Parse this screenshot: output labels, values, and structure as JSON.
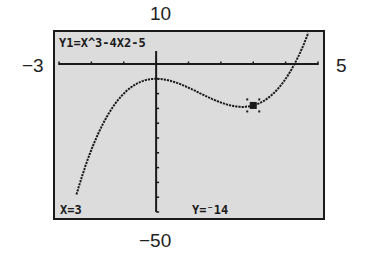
{
  "window": {
    "xmin_label": "−3",
    "xmax_label": "5",
    "ymax_label": "10",
    "ymin_label": "−50"
  },
  "screen": {
    "equation": "Y1=X^3-4X2-5",
    "trace_x": "X=3",
    "trace_y": "Y=⁻14",
    "background": "#dcdcdc",
    "ink": "#1a1a1a"
  },
  "chart_data": {
    "type": "line",
    "function": "x^3 - 4x^2 - 5",
    "coefficients": [
      1,
      -4,
      0,
      -5
    ],
    "xlim": [
      -3,
      5
    ],
    "ylim": [
      -50,
      10
    ],
    "xscale": 1,
    "yscale": 5,
    "grid": false,
    "trace_point": {
      "x": 3,
      "y": -14
    },
    "x": [
      -2.4,
      -2,
      -1.5,
      -1,
      -0.5,
      0,
      0.5,
      1,
      1.5,
      2,
      2.5,
      2.67,
      3,
      3.5,
      4,
      4.3,
      4.6
    ],
    "values": [
      -41.9,
      -29,
      -17.4,
      -10,
      -6.1,
      -5,
      -5.9,
      -8,
      -10.6,
      -13,
      -14.4,
      -14.5,
      -14,
      -10.1,
      -5,
      0.6,
      7.7
    ],
    "xlabel": "",
    "ylabel": ""
  }
}
